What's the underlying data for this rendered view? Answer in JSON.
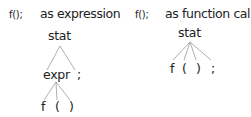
{
  "panels": [
    {
      "code": "f();",
      "caption": "as expression",
      "tree": {
        "root": "stat",
        "level1": [
          "expr",
          ";"
        ],
        "level2": [
          "f",
          "(",
          ")"
        ]
      }
    },
    {
      "code": "f();",
      "caption": "as function call",
      "tree": {
        "root": "stat",
        "level1": [
          "f",
          "(",
          ")",
          ";"
        ]
      }
    }
  ],
  "colors": {
    "text": "#222222",
    "edge": "#9a9a9a",
    "background": "#ffffff"
  }
}
